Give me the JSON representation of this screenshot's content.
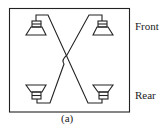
{
  "diagram": {
    "labels": {
      "front": "Front",
      "rear": "Rear"
    },
    "caption": "(a)",
    "colors": {
      "stroke": "#222222",
      "background": "#ffffff"
    },
    "speakers": [
      {
        "position": "front-left",
        "orientation": "cone-down"
      },
      {
        "position": "front-right",
        "orientation": "cone-down"
      },
      {
        "position": "rear-left",
        "orientation": "cone-up"
      },
      {
        "position": "rear-right",
        "orientation": "cone-up"
      }
    ],
    "wiring": "crossed: front-left to rear-right, front-right to rear-left (with hop-over at crossing)"
  }
}
